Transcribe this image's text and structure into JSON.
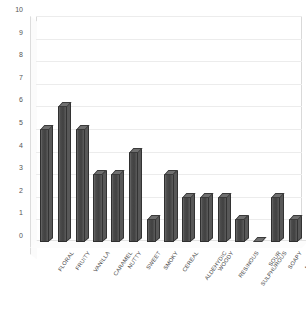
{
  "chart_data": {
    "type": "bar",
    "title": "",
    "subtitle": "",
    "xlabel": "",
    "ylabel": "",
    "ylim": [
      0,
      10
    ],
    "ytick_labels": [
      "0",
      "1",
      "2",
      "3",
      "4",
      "5",
      "6",
      "7",
      "8",
      "9",
      "10"
    ],
    "grid": true,
    "legend": false,
    "legend_position": "none",
    "style": "3d-column",
    "bar_color": "#4b4b4b",
    "categories": [
      "FLORAL",
      "FRUITY",
      "VANILLA",
      "CARAMEL",
      "NUTTY",
      "SWEET",
      "SMOKY",
      "CEREAL",
      "ALDEHYDIC",
      "WOODY",
      "RESINOUS",
      "SULPHUROUS",
      "SOUR",
      "SOAPY",
      "MUSTY"
    ],
    "values": [
      5,
      6,
      5,
      3,
      3,
      4,
      1,
      3,
      2,
      2,
      2,
      1,
      0,
      2,
      1
    ]
  }
}
